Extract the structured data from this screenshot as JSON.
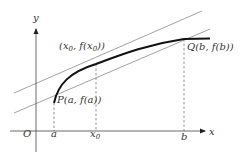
{
  "diagram": {
    "type": "mean-value-theorem-geometry",
    "colors": {
      "curve": "#111111",
      "axis": "#444444",
      "line": "#888888",
      "dashed": "#666666",
      "text": "#333333",
      "background": "#ffffff"
    },
    "axes": {
      "x_label": "x",
      "y_label": "y",
      "origin_label": "O"
    },
    "x_ticks": [
      {
        "label": "a",
        "sub": ""
      },
      {
        "label": "x",
        "sub": "0"
      },
      {
        "label": "b",
        "sub": ""
      }
    ],
    "points": {
      "P": {
        "name": "P",
        "coords": "(a, f(a))"
      },
      "tangent": {
        "name": "",
        "coords_pre": "(x",
        "coords_sub": "0",
        "coords_mid": ", f(x",
        "coords_sub2": "0",
        "coords_post": "))"
      },
      "Q": {
        "name": "Q",
        "coords": "(b, f(b))"
      }
    },
    "lines": [
      {
        "name": "tangent-line",
        "description": "tangent at (x0, f(x0)) parallel to secant PQ"
      },
      {
        "name": "secant-line",
        "description": "line through P and Q"
      }
    ]
  }
}
